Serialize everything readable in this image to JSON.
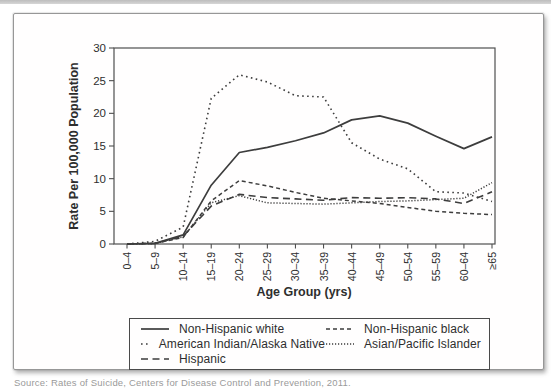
{
  "page": {
    "caption": "Source: Rates of Suicide, Centers for Disease Control and Prevention, 2011."
  },
  "chart_data": {
    "type": "line",
    "title": "",
    "xlabel": "Age Group (yrs)",
    "ylabel": "Rate Per 100,000 Population",
    "ylim": [
      0,
      30
    ],
    "yticks": [
      0,
      5,
      10,
      15,
      20,
      25,
      30
    ],
    "grid": false,
    "legend_position": "bottom-box",
    "line_color": "#3d3d3d",
    "axis_color": "#4f4f4f",
    "categories": [
      "0–4",
      "5–9",
      "10–14",
      "15–19",
      "20–24",
      "25–29",
      "30–34",
      "35–39",
      "40–44",
      "45–49",
      "50–54",
      "55–59",
      "60–64",
      "≥65"
    ],
    "series": [
      {
        "name": "Non-Hispanic white",
        "line_style": "solid",
        "values": [
          0,
          0.1,
          1.4,
          9.0,
          14.0,
          14.8,
          15.8,
          17.0,
          19.0,
          19.6,
          18.5,
          16.5,
          14.6,
          16.4
        ]
      },
      {
        "name": "American Indian/Alaska Native",
        "line_style": "coarse-dotted",
        "values": [
          0,
          0.4,
          2.6,
          22.3,
          25.9,
          24.8,
          22.7,
          22.5,
          15.5,
          13.0,
          11.5,
          8.0,
          7.8,
          6.5
        ]
      },
      {
        "name": "Hispanic",
        "line_style": "long-dash",
        "values": [
          0,
          0.1,
          1.2,
          5.8,
          7.6,
          7.1,
          6.9,
          6.7,
          7.1,
          7.0,
          7.1,
          6.9,
          6.2,
          8.0
        ]
      },
      {
        "name": "Non-Hispanic black",
        "line_style": "short-dash",
        "values": [
          0,
          0.1,
          1.0,
          6.6,
          9.7,
          8.9,
          7.9,
          7.0,
          6.6,
          6.2,
          5.6,
          5.0,
          4.7,
          4.5
        ]
      },
      {
        "name": "Asian/Pacific Islander",
        "line_style": "fine-dotted",
        "values": [
          0,
          0.1,
          1.1,
          6.3,
          7.4,
          6.3,
          6.2,
          6.1,
          6.3,
          6.5,
          6.6,
          6.8,
          7.0,
          9.4
        ]
      }
    ],
    "legend_order": [
      "Non-Hispanic white",
      "Non-Hispanic black",
      "American Indian/Alaska Native",
      "Asian/Pacific Islander",
      "Hispanic"
    ]
  }
}
